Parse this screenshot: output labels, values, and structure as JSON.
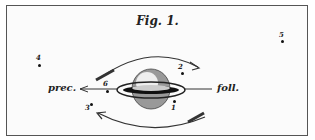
{
  "figure": {
    "title": "Fig. 1.",
    "direction_labels": {
      "preceding": "prec.",
      "following": "foll."
    },
    "satellites": [
      {
        "label": "1",
        "x": 174,
        "y": 101
      },
      {
        "label": "2",
        "x": 182,
        "y": 72
      },
      {
        "label": "3",
        "x": 91,
        "y": 104
      },
      {
        "label": "4",
        "x": 39,
        "y": 65
      },
      {
        "label": "5",
        "x": 282,
        "y": 41
      },
      {
        "label": "6",
        "x": 107,
        "y": 90
      }
    ],
    "central_body": "ringed-planet",
    "motion_arrows": [
      "upper-arc-clockwise-right",
      "lower-arc-leftward"
    ],
    "colors": {
      "ink": "#222222",
      "paper": "#fbfbfb"
    }
  }
}
